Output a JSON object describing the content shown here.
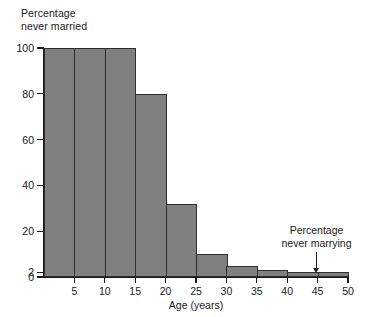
{
  "chart_data": {
    "type": "bar",
    "title": "",
    "subtitle": "",
    "xlabel": "Age (years)",
    "ylabel": "Percentage never married",
    "ylabel_lines": [
      "Percentage",
      "never married"
    ],
    "xlim": [
      0,
      50
    ],
    "ylim": [
      0,
      100
    ],
    "grid": false,
    "legend": false,
    "baseline_value": 2,
    "bin_width": 5,
    "categories": [
      "0-5",
      "5-10",
      "10-15",
      "15-20",
      "20-25",
      "25-30",
      "30-35",
      "35-40",
      "40-45",
      "45-50"
    ],
    "bins": [
      {
        "x0": 0,
        "x1": 5,
        "value": 100
      },
      {
        "x0": 5,
        "x1": 10,
        "value": 100
      },
      {
        "x0": 10,
        "x1": 15,
        "value": 100
      },
      {
        "x0": 15,
        "x1": 20,
        "value": 80
      },
      {
        "x0": 20,
        "x1": 25,
        "value": 32
      },
      {
        "x0": 25,
        "x1": 30,
        "value": 10
      },
      {
        "x0": 30,
        "x1": 35,
        "value": 5
      },
      {
        "x0": 35,
        "x1": 40,
        "value": 3
      },
      {
        "x0": 40,
        "x1": 45,
        "value": 2
      },
      {
        "x0": 45,
        "x1": 50,
        "value": 2
      }
    ],
    "values": [
      100,
      100,
      100,
      80,
      32,
      10,
      5,
      3,
      2,
      2
    ],
    "yticks": [
      {
        "value": 100,
        "label": "100"
      },
      {
        "value": 80,
        "label": "80"
      },
      {
        "value": 60,
        "label": "60"
      },
      {
        "value": 40,
        "label": "40"
      },
      {
        "value": 20,
        "label": "20"
      },
      {
        "value": 2,
        "label": "2"
      },
      {
        "value": 0,
        "label": "0"
      }
    ],
    "xticks": [
      {
        "value": 5,
        "label": "5"
      },
      {
        "value": 10,
        "label": "10"
      },
      {
        "value": 15,
        "label": "15"
      },
      {
        "value": 20,
        "label": "20"
      },
      {
        "value": 25,
        "label": "25"
      },
      {
        "value": 30,
        "label": "30"
      },
      {
        "value": 35,
        "label": "35"
      },
      {
        "value": 40,
        "label": "40"
      },
      {
        "value": 45,
        "label": "45"
      },
      {
        "value": 50,
        "label": "50"
      }
    ],
    "annotations": [
      {
        "lines": [
          "Percentage",
          "never marrying"
        ],
        "text": "Percentage never marrying",
        "points_to_x": 45,
        "points_to_y": 2
      }
    ],
    "colors": {
      "bar_fill": "#808080",
      "bar_edge": "#2e2e2e",
      "axis": "#1a1a1a",
      "text": "#1a1a1a",
      "background": "#ffffff"
    }
  }
}
